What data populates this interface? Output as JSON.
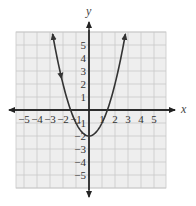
{
  "chart_data": {
    "type": "line",
    "title": "",
    "xlabel": "x",
    "ylabel": "y",
    "function": "y = x^2 - 2",
    "xlim": [
      -5.6,
      5.9
    ],
    "ylim": [
      -6,
      6
    ],
    "grid": true,
    "x_ticks": [
      -5,
      -4,
      -3,
      -2,
      -1,
      1,
      2,
      3,
      4,
      5
    ],
    "x_tick_labels": [
      "−5",
      "−4",
      "−3",
      "−2",
      "−1",
      "1",
      "2",
      "3",
      "4",
      "5"
    ],
    "y_ticks": [
      5,
      4,
      3,
      2,
      1,
      -1,
      -2,
      -3,
      -4,
      -5
    ],
    "y_tick_labels": [
      "5",
      "4",
      "3",
      "2",
      "1",
      "−1",
      "−2",
      "−3",
      "−4",
      "−5"
    ],
    "series": [
      {
        "name": "parabola",
        "x": [
          -2.8,
          -2.5,
          -2,
          -1.5,
          -1,
          -0.5,
          0,
          0.5,
          1,
          1.5,
          2,
          2.5,
          2.8
        ],
        "y": [
          5.84,
          4.25,
          2,
          0.25,
          -1,
          -1.75,
          -2,
          -1.75,
          -1,
          0.25,
          2,
          4.25,
          5.84
        ],
        "arrows_at_ends": true
      }
    ],
    "vertex": [
      0,
      -2
    ],
    "colors": {
      "grid_fill": "#eeeeee",
      "grid_line": "#c8c8c8",
      "axis": "#222222",
      "curve": "#333333"
    }
  }
}
